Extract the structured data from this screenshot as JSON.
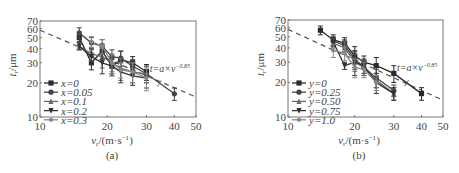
{
  "chart_data": [
    {
      "type": "line",
      "panel": "(a)",
      "xlabel": "v_r/(m·s⁻¹)",
      "ylabel": "t_r/μm",
      "xscale": "log",
      "yscale": "log",
      "xlim": [
        10,
        50
      ],
      "ylim": [
        10,
        70
      ],
      "xticks": [
        10,
        20,
        30,
        40,
        50
      ],
      "yticks": [
        10,
        20,
        30,
        40,
        50,
        60,
        70
      ],
      "annotation": "t=a×v^-0.85",
      "fit": {
        "label": "t=a×v^-0.85",
        "style": "dashed",
        "points": [
          [
            10,
            58
          ],
          [
            50,
            15
          ]
        ]
      },
      "legend_position": "lower left",
      "series": [
        {
          "name": "x=0",
          "marker": "square",
          "x": [
            15,
            17,
            19,
            21,
            23,
            26,
            30
          ],
          "y": [
            50,
            30,
            38,
            28,
            32,
            30,
            25
          ],
          "err": [
            4,
            4,
            6,
            4,
            6,
            4,
            4
          ]
        },
        {
          "name": "x=0.05",
          "marker": "circle",
          "x": [
            15,
            17,
            19,
            21,
            23,
            26,
            30,
            40
          ],
          "y": [
            55,
            45,
            42,
            34,
            33,
            28,
            24,
            16
          ],
          "err": [
            6,
            5,
            6,
            5,
            5,
            4,
            4,
            2
          ]
        },
        {
          "name": "x=0.1",
          "marker": "triangle",
          "x": [
            15,
            17,
            19,
            21,
            23,
            26,
            30
          ],
          "y": [
            42,
            36,
            34,
            30,
            27,
            25,
            24
          ],
          "err": [
            3,
            5,
            7,
            5,
            6,
            5,
            4
          ]
        },
        {
          "name": "x=0.2",
          "marker": "tri-down",
          "x": [
            15,
            17,
            19,
            21,
            23,
            26,
            30
          ],
          "y": [
            42,
            34,
            30,
            28,
            25,
            23,
            22
          ],
          "err": [
            3,
            5,
            6,
            5,
            5,
            4,
            4
          ]
        },
        {
          "name": "x=0.3",
          "marker": "star",
          "x": [
            17,
            19,
            21,
            23,
            26,
            30
          ],
          "y": [
            46,
            42,
            30,
            26,
            25,
            22
          ],
          "err": [
            5,
            6,
            6,
            4,
            5,
            5
          ]
        }
      ]
    },
    {
      "type": "line",
      "panel": "(b)",
      "xlabel": "v_r/(m·s⁻¹)",
      "ylabel": "t_r/μm",
      "xscale": "log",
      "yscale": "log",
      "xlim": [
        10,
        50
      ],
      "ylim": [
        10,
        70
      ],
      "xticks": [
        10,
        20,
        30,
        40,
        50
      ],
      "yticks": [
        10,
        20,
        30,
        40,
        50,
        60,
        70
      ],
      "annotation": "t=a×v^-0.85",
      "fit": {
        "label": "t=a×v^-0.85",
        "style": "dashed",
        "points": [
          [
            10,
            58
          ],
          [
            50,
            14
          ]
        ]
      },
      "legend_position": "lower left",
      "series": [
        {
          "name": "y=0",
          "marker": "square",
          "x": [
            14,
            16,
            18,
            20,
            22,
            25,
            30,
            40
          ],
          "y": [
            57,
            47,
            44,
            34,
            30,
            28,
            24,
            16
          ],
          "err": [
            5,
            5,
            5,
            7,
            4,
            5,
            4,
            2
          ]
        },
        {
          "name": "y=0.25",
          "marker": "circle",
          "x": [
            16,
            18,
            20,
            22,
            25,
            30
          ],
          "y": [
            46,
            42,
            32,
            27,
            22,
            17
          ],
          "err": [
            4,
            5,
            6,
            4,
            4,
            2
          ]
        },
        {
          "name": "y=0.50",
          "marker": "triangle",
          "x": [
            16,
            18,
            20,
            22,
            25,
            30
          ],
          "y": [
            44,
            40,
            30,
            27,
            21,
            16
          ],
          "err": [
            4,
            5,
            5,
            4,
            3,
            2
          ]
        },
        {
          "name": "y=0.75",
          "marker": "tri-down",
          "x": [
            16,
            18,
            20,
            22,
            25,
            30
          ],
          "y": [
            45,
            28,
            30,
            28,
            20,
            16
          ],
          "err": [
            4,
            2,
            7,
            4,
            4,
            2
          ]
        },
        {
          "name": "y=1.0",
          "marker": "star",
          "x": [
            16,
            18,
            20,
            22,
            25
          ],
          "y": [
            38,
            36,
            27,
            26,
            20
          ],
          "err": [
            5,
            5,
            5,
            4,
            3
          ]
        }
      ]
    }
  ],
  "panels": {
    "a": {
      "caption": "(a)",
      "xlabel_main": "v",
      "xlabel_sub": "r",
      "xlabel_rest": "/(m·s",
      "xlabel_exp": "−1",
      "xlabel_close": ")",
      "ylabel_main": "t",
      "ylabel_sub": "r",
      "ylabel_rest": "/μm",
      "xticks": [
        "10",
        "20",
        "30",
        "40",
        "50"
      ],
      "yticks": [
        "10",
        "20",
        "30",
        "40",
        "50",
        "60",
        "70"
      ],
      "annotation_base": "t=a×v",
      "annotation_exp": "−0.85",
      "legend": [
        "x=0",
        "x=0.05",
        "x=0.1",
        "x=0.2",
        "x=0.3"
      ]
    },
    "b": {
      "caption": "(b)",
      "xlabel_main": "v",
      "xlabel_sub": "r",
      "xlabel_rest": "/(m·s",
      "xlabel_exp": "−1",
      "xlabel_close": ")",
      "ylabel_main": "t",
      "ylabel_sub": "r",
      "ylabel_rest": "/μm",
      "xticks": [
        "10",
        "20",
        "30",
        "40",
        "50"
      ],
      "yticks": [
        "10",
        "20",
        "30",
        "40",
        "50",
        "60",
        "70"
      ],
      "annotation_base": "t=a×v",
      "annotation_exp": "−0.85",
      "legend": [
        "y=0",
        "y=0.25",
        "y=0.50",
        "y=0.75",
        "y=1.0"
      ]
    }
  },
  "colors": {
    "series": [
      "#2a2a2a",
      "#444444",
      "#6a6a6a",
      "#333333",
      "#888888"
    ],
    "fit": "#555555",
    "axis": "#777777"
  }
}
